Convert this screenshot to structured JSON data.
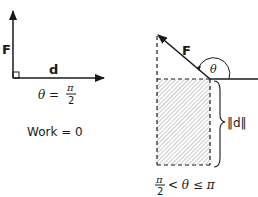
{
  "left_panel": {
    "force_label": "F",
    "displacement_label": "d",
    "angle_equation": {
      "lhs": "θ =",
      "numerator": "π",
      "denominator": "2"
    },
    "work_label": "Work = 0"
  },
  "right_panel": {
    "force_label": "F",
    "angle_label": "θ",
    "magnitude_label": "‖d‖",
    "angle_range": {
      "numerator": "π",
      "denominator": "2",
      "rest": "< θ ≤ π"
    }
  },
  "colors": {
    "stroke": "#1a1a1a",
    "hatch": "#8a8a8a",
    "background": "#ffffff"
  }
}
